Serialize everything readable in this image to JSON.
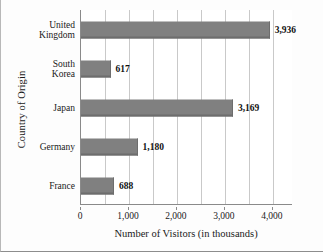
{
  "chart_data": {
    "type": "bar",
    "orientation": "horizontal",
    "title": "",
    "xlabel": "Number of Visitors (in thousands)",
    "ylabel": "Country of Origin",
    "categories": [
      "United Kingdom",
      "South Korea",
      "Japan",
      "Germany",
      "France"
    ],
    "values": [
      3936,
      617,
      3169,
      1180,
      688
    ],
    "value_labels": [
      "3,936",
      "617",
      "3,169",
      "1,180",
      "688"
    ],
    "xlim": [
      0,
      4400
    ],
    "xticks": [
      0,
      1000,
      2000,
      3000,
      4000
    ],
    "xtick_labels": [
      "0",
      "1,000",
      "2,000",
      "3,000",
      "4,000"
    ],
    "gridlines": [
      0,
      500,
      1000,
      1500,
      2000,
      2500,
      3000,
      3500,
      4000
    ],
    "grid": true,
    "grid_axis": "x",
    "legend": false,
    "bar_color": "#808080",
    "bar_edge_color": "#6d6d6d",
    "grid_color": "#c9c9c9",
    "axis_color": "#8a8a8a",
    "background_color": "#ffffff"
  }
}
